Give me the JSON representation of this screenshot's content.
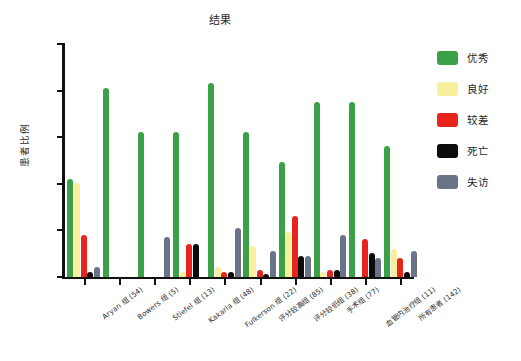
{
  "chart_data": {
    "type": "bar",
    "title": "结果",
    "xlabel": "",
    "ylabel": "患者比例",
    "ylim": [
      0,
      100
    ],
    "yticks": [
      0,
      20,
      40,
      60,
      80,
      100
    ],
    "ytick_labels": [
      "",
      "",
      "",
      "",
      "",
      ""
    ],
    "grid": false,
    "legend_position": "right",
    "categories": [
      "Aryan 组 (54)",
      "Bowers 组 (5)",
      "Stiefel 组 (13)",
      "Kakarla 组 (48)",
      "Fulkerson 组 (22)",
      "评分较高组 (85)",
      "评分较低组 (38)",
      "手术组 (77)",
      "血管内治疗组 (11)",
      "所有患者 (142)"
    ],
    "series": [
      {
        "name": "优秀",
        "color": "#3aa149",
        "values": [
          42,
          81,
          62,
          62,
          83,
          62,
          49,
          75,
          75,
          56
        ]
      },
      {
        "name": "良好",
        "color": "#f7ef9c",
        "values": [
          40,
          0,
          0,
          2,
          4,
          13,
          19,
          2,
          0,
          12
        ]
      },
      {
        "name": "较差",
        "color": "#e8251c",
        "values": [
          18,
          0,
          0,
          14,
          2,
          3,
          26,
          3,
          16,
          8
        ]
      },
      {
        "name": "死亡",
        "color": "#0c0c0c",
        "values": [
          2,
          0,
          0,
          14,
          2,
          1,
          9,
          3,
          10,
          2
        ]
      },
      {
        "name": "失访",
        "color": "#6a7489",
        "values": [
          4,
          0,
          17,
          0,
          21,
          11,
          9,
          18,
          8,
          11
        ]
      }
    ]
  },
  "legend": {
    "items": [
      {
        "label": "优秀",
        "color": "#3aa149"
      },
      {
        "label": "良好",
        "color": "#f7ef9c"
      },
      {
        "label": "较差",
        "color": "#e8251c"
      },
      {
        "label": "死亡",
        "color": "#0c0c0c"
      },
      {
        "label": "失访",
        "color": "#6a7489"
      }
    ]
  }
}
